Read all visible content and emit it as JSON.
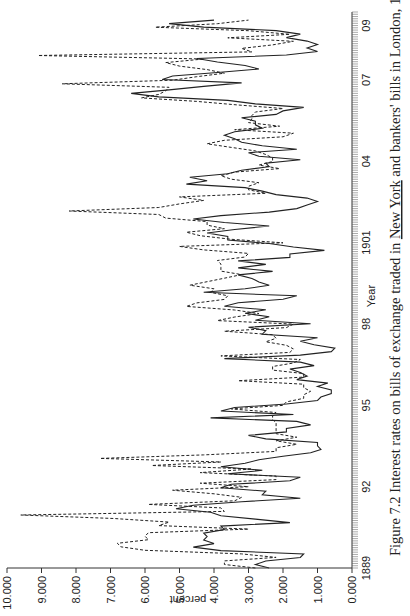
{
  "chart_data": {
    "type": "line",
    "title": "Figure 7.2 Interest rates on bills of exchange traded in New York and bankers' bills in London, 1889–1909, end-month data",
    "caption_prefix": "Figure 7.2 Interest rates on bills of exchange traded in ",
    "caption_underlined": "New York",
    "caption_suffix": " and bankers' bills in London, 1889–1909, end-month data",
    "xlabel": "Year",
    "ylabel": "percent",
    "ylim": [
      0,
      10
    ],
    "xlim": [
      1889,
      1909.5
    ],
    "x_ticks": [
      {
        "value": 1889,
        "label": "1889"
      },
      {
        "value": 1892,
        "label": "92"
      },
      {
        "value": 1895,
        "label": "95"
      },
      {
        "value": 1898,
        "label": "98"
      },
      {
        "value": 1901,
        "label": "1901"
      },
      {
        "value": 1904,
        "label": "04"
      },
      {
        "value": 1907,
        "label": "07"
      },
      {
        "value": 1909,
        "label": "09"
      }
    ],
    "y_ticks": [
      "0.000",
      "1.000",
      "2.000",
      "3.000",
      "4.000",
      "5.000",
      "6.000",
      "7.000",
      "8.000",
      "9.000",
      "10.000"
    ],
    "grid": false,
    "legend": "none",
    "series": [
      {
        "name": "New York bills of exchange (solid)",
        "style": "solid",
        "x_start": 1889.0,
        "x_end": 1909.2,
        "values": [
          2.4,
          2.8,
          2.5,
          1.5,
          1.4,
          3.8,
          4.6,
          4.0,
          4.3,
          4.2,
          4.3,
          3.7,
          3.8,
          1.8,
          2.8,
          3.8,
          4.1,
          5.1,
          4.6,
          3.2,
          1.5,
          2.6,
          2.5,
          3.8,
          3.5,
          1.8,
          1.5,
          3.6,
          2.6,
          3.8,
          3.1,
          2.7,
          2.0,
          1.2,
          0.9,
          1.0,
          1.0,
          2.5,
          3.0,
          1.9,
          1.9,
          1.2,
          1.6,
          4.1,
          1.7,
          3.8,
          3.4,
          1.9,
          1.0,
          0.9,
          0.6,
          0.6,
          1.0,
          0.7,
          1.6,
          1.3,
          1.5,
          1.8,
          1.1,
          1.5,
          3.7,
          1.5,
          0.6,
          0.5,
          1.1,
          1.5,
          1.0,
          2.6,
          2.5,
          3.0,
          1.2,
          2.8,
          2.4,
          3.1,
          2.5,
          3.7,
          3.3,
          2.0,
          1.6,
          4.3,
          3.1,
          2.4,
          2.7,
          2.9,
          3.3,
          2.3,
          3.3,
          2.5,
          3.3,
          1.8,
          1.8,
          0.8,
          1.7,
          2.4,
          3.6,
          3.6,
          4.2,
          3.4,
          2.4,
          3.7,
          4.6,
          3.8,
          2.4,
          1.6,
          1.3,
          1.0,
          1.3,
          2.2,
          2.6,
          3.1,
          4.8,
          4.2,
          4.7,
          3.6,
          3.2,
          2.4,
          2.5,
          1.5,
          2.7,
          3.0,
          1.6,
          2.6,
          3.2,
          3.4,
          3.7,
          3.4,
          2.6,
          2.8,
          2.8,
          3.2,
          2.2,
          2.0,
          1.4,
          2.8,
          3.6,
          5.6,
          6.4,
          5.3,
          4.3,
          3.2,
          5.5,
          5.2,
          3.9,
          2.7,
          3.1,
          3.9,
          4.5,
          1.9,
          1.0,
          1.3,
          1.0,
          1.3,
          1.9,
          1.5,
          2.2,
          4.3,
          5.3,
          4.0
        ]
      },
      {
        "name": "Bankers' bills in London (dashed)",
        "style": "dashed",
        "x_start": 1889.0,
        "x_end": 1909.2,
        "values": [
          2.8,
          3.7,
          3.7,
          2.2,
          3.2,
          6.0,
          6.7,
          6.8,
          5.9,
          6.0,
          5.9,
          3.0,
          5.6,
          5.3,
          6.9,
          9.6,
          3.7,
          3.8,
          5.9,
          3.4,
          3.2,
          4.0,
          5.2,
          3.0,
          4.4,
          2.2,
          2.2,
          4.4,
          2.9,
          5.8,
          3.8,
          7.3,
          4.3,
          2.2,
          2.2,
          1.6,
          2.2,
          1.6,
          2.2,
          2.2,
          2.2,
          2.2,
          2.3,
          2.3,
          2.2,
          3.5,
          2.0,
          1.9,
          1.4,
          1.4,
          1.2,
          1.4,
          1.4,
          3.3,
          1.4,
          1.4,
          2.3,
          2.3,
          1.7,
          1.5,
          3.8,
          1.8,
          1.7,
          1.9,
          2.5,
          2.2,
          2.3,
          3.7,
          1.9,
          1.7,
          3.9,
          3.4,
          2.7,
          3.4,
          4.8,
          4.5,
          3.7,
          3.6,
          4.1,
          4.0,
          4.7,
          4.2,
          3.7,
          3.2,
          3.8,
          3.8,
          3.8,
          3.9,
          3.1,
          3.0,
          4.3,
          5.0,
          2.0,
          3.5,
          4.4,
          4.8,
          3.7,
          4.2,
          4.2,
          5.4,
          5.6,
          8.2,
          5.6,
          5.0,
          4.3,
          5.0,
          2.5,
          3.0,
          3.0,
          2.7,
          3.5,
          3.8,
          3.4,
          2.1,
          2.7,
          2.3,
          2.3,
          2.5,
          2.8,
          3.5,
          4.2,
          3.7,
          2.0,
          1.7,
          3.4,
          2.1,
          3.0,
          2.9,
          2.9,
          2.8,
          2.0,
          3.3,
          4.5,
          6.1,
          5.6,
          5.4,
          5.3,
          8.4,
          5.2,
          4.5,
          3.7,
          4.2,
          5.0,
          5.4,
          4.3,
          9.1,
          2.9,
          3.2,
          2.3,
          1.7,
          3.6,
          1.8,
          3.0,
          5.7,
          3.9,
          3.0
        ]
      }
    ]
  }
}
